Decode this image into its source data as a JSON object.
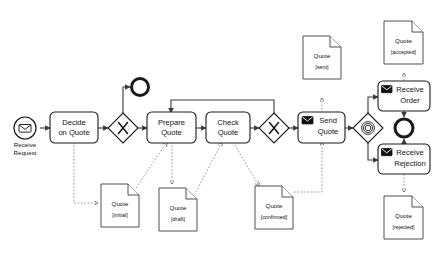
{
  "diagram": {
    "notation": "BPMN 2.0",
    "background": "#ffffff",
    "stroke_color": "#1a1a1a",
    "association_color": "#8a8a8a"
  },
  "events": {
    "start": {
      "label": "Receive\nRequest",
      "label_line1": "Receive",
      "label_line2": "Request",
      "type": "message-start-event",
      "icon": "envelope-icon"
    },
    "end_top": {
      "label": "",
      "type": "end-event"
    },
    "end_right": {
      "label": "",
      "type": "end-event"
    }
  },
  "tasks": [
    {
      "id": "decide-on-quote",
      "line1": "Decide",
      "line2": "on Quote",
      "type": "task",
      "icon": null
    },
    {
      "id": "prepare-quote",
      "line1": "Prepare",
      "line2": "Quote",
      "type": "task",
      "icon": null
    },
    {
      "id": "check-quote",
      "line1": "Check",
      "line2": "Quote",
      "type": "task",
      "icon": null
    },
    {
      "id": "send-quote",
      "line1": "Send",
      "line2": "Quote",
      "type": "send-task",
      "icon": "envelope-icon"
    },
    {
      "id": "receive-order",
      "line1": "Receive",
      "line2": "Order",
      "type": "receive-task",
      "icon": "envelope-icon"
    },
    {
      "id": "receive-rejection",
      "line1": "Receive",
      "line2": "Rejection",
      "type": "receive-task",
      "icon": "envelope-icon"
    }
  ],
  "gateways": [
    {
      "id": "gateway-xor-1",
      "type": "exclusive",
      "symbol": "X"
    },
    {
      "id": "gateway-xor-2",
      "type": "exclusive",
      "symbol": "X"
    },
    {
      "id": "gateway-event-based",
      "type": "event-based",
      "symbol": "circles"
    }
  ],
  "data_objects": [
    {
      "id": "quote-initial",
      "name": "Quote",
      "state": "[initial]"
    },
    {
      "id": "quote-draft",
      "name": "Quote",
      "state": "[draft]"
    },
    {
      "id": "quote-confirmed",
      "name": "Quote",
      "state": "[confirmed]"
    },
    {
      "id": "quote-sent",
      "name": "Quote",
      "state": "[sent]"
    },
    {
      "id": "quote-accepted",
      "name": "Quote",
      "state": "[accepted]"
    },
    {
      "id": "quote-rejected",
      "name": "Quote",
      "state": "[rejected]"
    }
  ]
}
